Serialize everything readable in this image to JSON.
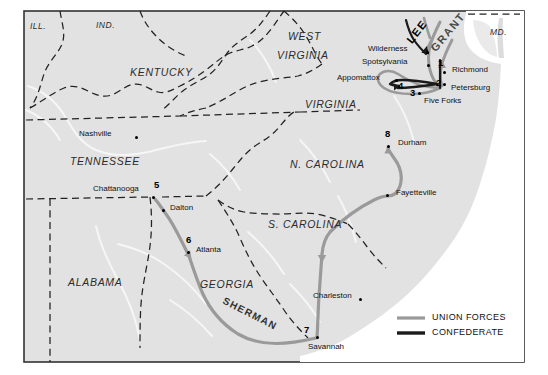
{
  "map": {
    "title": "Civil War Campaigns Map",
    "background_color": "#e3e3e3",
    "land_color": "#dcdcdc",
    "water_color": "#ffffff",
    "border_color": "#333333",
    "union_color": "#9a9a9a",
    "confederate_color": "#1a1a1a",
    "river_color": "#f4f4f4"
  },
  "states": [
    {
      "name": "ILL.",
      "x": 30,
      "y": 27,
      "size": "sm"
    },
    {
      "name": "IND.",
      "x": 96,
      "y": 26,
      "size": "sm"
    },
    {
      "name": "KENTUCKY",
      "x": 130,
      "y": 73,
      "size": "lg"
    },
    {
      "name": "WEST",
      "x": 288,
      "y": 37,
      "size": "lg"
    },
    {
      "name": "VIRGINIA",
      "x": 277,
      "y": 56,
      "size": "lg"
    },
    {
      "name": "VIRGINIA",
      "x": 305,
      "y": 105,
      "size": "lg"
    },
    {
      "name": "MD.",
      "x": 490,
      "y": 33,
      "size": "sm"
    },
    {
      "name": "TENNESSEE",
      "x": 70,
      "y": 162,
      "size": "lg"
    },
    {
      "name": "N. CAROLINA",
      "x": 290,
      "y": 165,
      "size": "lg"
    },
    {
      "name": "S. CAROLINA",
      "x": 268,
      "y": 225,
      "size": "lg"
    },
    {
      "name": "ALABAMA",
      "x": 68,
      "y": 283,
      "size": "lg"
    },
    {
      "name": "GEORGIA",
      "x": 200,
      "y": 285,
      "size": "lg"
    }
  ],
  "cities": [
    {
      "name": "Nashville",
      "label_x": 79,
      "label_y": 134,
      "dot_x": 135,
      "dot_y": 138,
      "anchor": "left"
    },
    {
      "name": "Chattanooga",
      "label_x": 93,
      "label_y": 189,
      "dot_x": 153,
      "dot_y": 198,
      "anchor": "left"
    },
    {
      "name": "Dalton",
      "label_x": 170,
      "label_y": 208,
      "dot_x": 163,
      "dot_y": 211,
      "anchor": "left"
    },
    {
      "name": "Atlanta",
      "label_x": 196,
      "label_y": 250,
      "dot_x": 188,
      "dot_y": 253,
      "anchor": "left"
    },
    {
      "name": "Savannah",
      "label_x": 308,
      "label_y": 347,
      "dot_x": 318,
      "dot_y": 338,
      "anchor": "left"
    },
    {
      "name": "Charleston",
      "label_x": 313,
      "label_y": 296,
      "dot_x": 360,
      "dot_y": 300,
      "anchor": "left"
    },
    {
      "name": "Fayetteville",
      "label_x": 396,
      "label_y": 193,
      "dot_x": 388,
      "dot_y": 196,
      "anchor": "left"
    },
    {
      "name": "Durham",
      "label_x": 398,
      "label_y": 143,
      "dot_x": 389,
      "dot_y": 147,
      "anchor": "left"
    },
    {
      "name": "Wilderness",
      "label_x": 368,
      "label_y": 49,
      "dot_x": 427,
      "dot_y": 53,
      "anchor": "left"
    },
    {
      "name": "Spotsylvania",
      "label_x": 362,
      "label_y": 62,
      "dot_x": 428,
      "dot_y": 66,
      "anchor": "left"
    },
    {
      "name": "Appomattox",
      "label_x": 337,
      "label_y": 78,
      "dot_x": 396,
      "dot_y": 81,
      "anchor": "left"
    },
    {
      "name": "Richmond",
      "label_x": 452,
      "label_y": 70,
      "dot_x": 444,
      "dot_y": 73,
      "anchor": "left"
    },
    {
      "name": "Petersburg",
      "label_x": 451,
      "label_y": 88,
      "dot_x": 444,
      "dot_y": 85,
      "anchor": "left"
    },
    {
      "name": "Five Forks",
      "label_x": 424,
      "label_y": 101,
      "dot_x": 419,
      "dot_y": 94,
      "anchor": "left"
    }
  ],
  "markers": [
    {
      "number": "1",
      "x": 438,
      "y": 63
    },
    {
      "number": "2",
      "x": 437,
      "y": 83
    },
    {
      "number": "3",
      "x": 411,
      "y": 92
    },
    {
      "number": "4",
      "x": 399,
      "y": 85
    },
    {
      "number": "5",
      "x": 155,
      "y": 185
    },
    {
      "number": "6",
      "x": 187,
      "y": 240
    },
    {
      "number": "7",
      "x": 305,
      "y": 330
    },
    {
      "number": "8",
      "x": 386,
      "y": 134
    }
  ],
  "commanders": [
    {
      "name": "LEE",
      "x": 404,
      "y": 38,
      "rotate": -52,
      "side": "confederate"
    },
    {
      "name": "GRANT",
      "x": 428,
      "y": 46,
      "rotate": -50,
      "side": "union"
    },
    {
      "name": "SHERMAN",
      "x": 226,
      "y": 295,
      "rotate": 27,
      "side": "union"
    }
  ],
  "legend": {
    "union_label": "UNION FORCES",
    "confederate_label": "CONFEDERATE",
    "union_color": "#9a9a9a",
    "confederate_color": "#1a1a1a"
  }
}
